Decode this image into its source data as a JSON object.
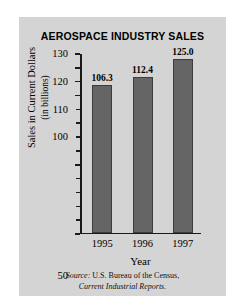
{
  "chart_data": {
    "type": "bar",
    "title": "AEROSPACE INDUSTRY SALES",
    "xlabel": "Year",
    "ylabel_line1": "Sales in Current Dollars",
    "ylabel_line2": "(in billions)",
    "categories": [
      "1995",
      "1996",
      "1997"
    ],
    "values": [
      106.3,
      112.4,
      125.0
    ],
    "value_labels": [
      "106.3",
      "112.4",
      "125.0"
    ],
    "ylim": [
      0,
      130
    ],
    "ytick_labels": [
      "130",
      "120",
      "110",
      "100",
      "50",
      "0"
    ],
    "ytick_values": [
      130,
      120,
      110,
      100,
      50,
      0
    ],
    "ytick_step": 10,
    "grid": false,
    "legend": false,
    "bar_color": "#656565",
    "bar_edge_color": "#3c3c3c",
    "panel_color": "#d4d4d4",
    "axis_color": "#1a1a1a"
  },
  "source": {
    "label": "Source:",
    "line1_rest": " U.S. Bureau of the Census,",
    "line2": "Current Industrial Reports."
  }
}
